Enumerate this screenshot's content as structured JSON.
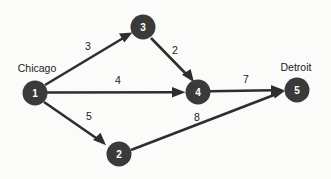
{
  "diagram": {
    "type": "directed-network-graph",
    "background_color": "#fbfbfa",
    "node_color": "#3a3a3a",
    "node_label_color": "#ffffff",
    "edge_color": "#2e2e2e",
    "text_color": "#1c1c1c",
    "nodes": [
      {
        "id": "1",
        "label": "1",
        "city": "Chicago",
        "cx": 35,
        "cy": 93,
        "r": 12.5,
        "city_x": 37,
        "city_y": 68
      },
      {
        "id": "2",
        "label": "2",
        "city": "",
        "cx": 119,
        "cy": 154,
        "r": 12.5,
        "city_x": 0,
        "city_y": 0
      },
      {
        "id": "3",
        "label": "3",
        "city": "",
        "cx": 143,
        "cy": 27,
        "r": 12.5,
        "city_x": 0,
        "city_y": 0
      },
      {
        "id": "4",
        "label": "4",
        "city": "",
        "cx": 198,
        "cy": 92,
        "r": 12.5,
        "city_x": 0,
        "city_y": 0
      },
      {
        "id": "5",
        "label": "5",
        "city": "Detroit",
        "cx": 297,
        "cy": 90,
        "r": 12.5,
        "city_x": 296,
        "city_y": 67
      }
    ],
    "edges": [
      {
        "id": "e1",
        "from": "1",
        "to": "3",
        "weight": "3",
        "label_x": 88,
        "label_y": 46
      },
      {
        "id": "e2",
        "from": "3",
        "to": "4",
        "weight": "2",
        "label_x": 175,
        "label_y": 50
      },
      {
        "id": "e3",
        "from": "1",
        "to": "4",
        "weight": "4",
        "label_x": 118,
        "label_y": 80
      },
      {
        "id": "e4",
        "from": "4",
        "to": "5",
        "weight": "7",
        "label_x": 246,
        "label_y": 79
      },
      {
        "id": "e5",
        "from": "1",
        "to": "2",
        "weight": "5",
        "label_x": 89,
        "label_y": 116
      },
      {
        "id": "e6",
        "from": "2",
        "to": "5",
        "weight": "8",
        "label_x": 197,
        "label_y": 117
      }
    ]
  }
}
